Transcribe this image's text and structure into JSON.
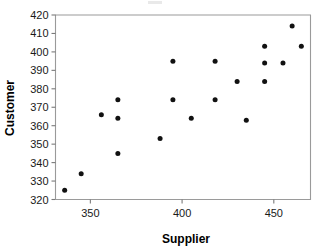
{
  "chart_data": {
    "type": "scatter",
    "title": "",
    "xlabel": "Supplier",
    "ylabel": "Customer",
    "xlim": [
      331,
      470
    ],
    "ylim": [
      320,
      420
    ],
    "xticks": [
      350,
      400,
      450
    ],
    "yticks": [
      320,
      330,
      340,
      350,
      360,
      370,
      380,
      390,
      400,
      410,
      420
    ],
    "xtick_labels": [
      "350",
      "400",
      "450"
    ],
    "ytick_labels": [
      "320",
      "330",
      "340",
      "350",
      "360",
      "370",
      "380",
      "390",
      "400",
      "410",
      "420"
    ],
    "grid": false,
    "legend": null,
    "marker": "filled-circle",
    "marker_color": "#111111",
    "frame_color": "#9a9a9a",
    "points": [
      {
        "x": 336,
        "y": 325
      },
      {
        "x": 345,
        "y": 334
      },
      {
        "x": 356,
        "y": 366
      },
      {
        "x": 365,
        "y": 374
      },
      {
        "x": 365,
        "y": 364
      },
      {
        "x": 365,
        "y": 345
      },
      {
        "x": 388,
        "y": 353
      },
      {
        "x": 395,
        "y": 395
      },
      {
        "x": 395,
        "y": 374
      },
      {
        "x": 405,
        "y": 364
      },
      {
        "x": 418,
        "y": 395
      },
      {
        "x": 418,
        "y": 374
      },
      {
        "x": 430,
        "y": 384
      },
      {
        "x": 435,
        "y": 363
      },
      {
        "x": 445,
        "y": 403
      },
      {
        "x": 445,
        "y": 394
      },
      {
        "x": 445,
        "y": 384
      },
      {
        "x": 455,
        "y": 394
      },
      {
        "x": 460,
        "y": 414
      },
      {
        "x": 465,
        "y": 403
      }
    ]
  },
  "axes": {
    "x_title": "Supplier",
    "y_title": "Customer"
  }
}
